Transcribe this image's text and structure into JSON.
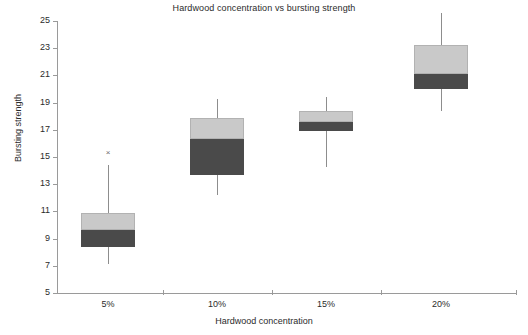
{
  "chart_data": {
    "type": "box",
    "title": "Hardwood concentration vs bursting strength",
    "xlabel": "Hardwood concentration",
    "ylabel": "Bursting strength",
    "categories": [
      "5%",
      "10%",
      "15%",
      "20%"
    ],
    "ylim": [
      5,
      25
    ],
    "ytick_labels": [
      "5",
      "7",
      "9",
      "11",
      "13",
      "15",
      "17",
      "19",
      "21",
      "23",
      "25"
    ],
    "ytick_values": [
      5,
      7,
      9,
      11,
      13,
      15,
      17,
      19,
      21,
      23,
      25
    ],
    "grid": false,
    "legend": null,
    "colors": {
      "upper_box_fill": "#c9c9c9",
      "lower_box_fill": "#4a4a4a",
      "whisker": "#8d8d8d",
      "axis": "#9a9a9a",
      "text": "#2b2b2b",
      "background": "#ffffff"
    },
    "boxes": [
      {
        "category": "5%",
        "whisker_low": 7.1,
        "q1": 8.4,
        "median": 9.6,
        "q3": 10.9,
        "whisker_high": 14.4,
        "outliers": [
          15.3
        ]
      },
      {
        "category": "10%",
        "whisker_low": 12.2,
        "q1": 13.7,
        "median": 16.3,
        "q3": 17.9,
        "whisker_high": 19.3,
        "outliers": []
      },
      {
        "category": "15%",
        "whisker_low": 14.3,
        "q1": 16.9,
        "median": 17.6,
        "q3": 18.4,
        "whisker_high": 19.4,
        "outliers": []
      },
      {
        "category": "20%",
        "whisker_low": 18.4,
        "q1": 20.0,
        "median": 21.1,
        "q3": 23.2,
        "whisker_high": 25.6,
        "outliers": []
      }
    ],
    "outlier_glyph": "×"
  },
  "geometry": {
    "plot_left": 57,
    "plot_right": 516,
    "y_top_px": 21,
    "y_bottom_px": 293,
    "value_top": 25,
    "value_bottom": 5,
    "box_half_width": 27,
    "category_centers_px": [
      108,
      217,
      326,
      441
    ],
    "x_tick_positions_px": [
      163,
      272,
      381,
      516
    ]
  }
}
